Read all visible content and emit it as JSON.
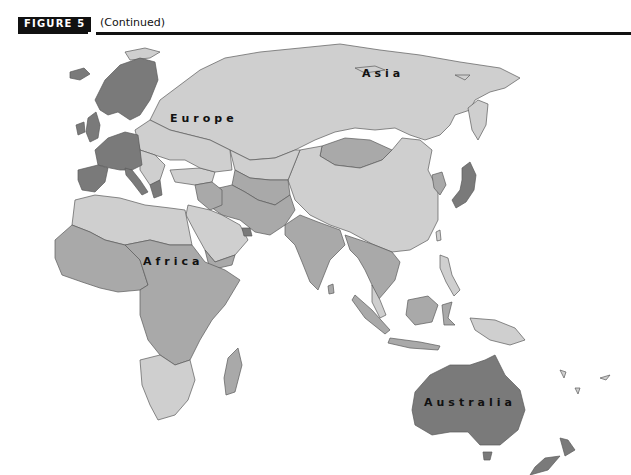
{
  "figure": {
    "label": "FIGURE 5",
    "caption": "(Continued)"
  },
  "map": {
    "type": "choropleth-world-map",
    "region_shown": "Eastern Hemisphere (Europe, Asia, Africa, Oceania)",
    "labels": {
      "europe": "Europe",
      "asia": "Asia",
      "africa": "Africa",
      "australia": "Australia"
    },
    "colors": {
      "ocean": "#ffffff",
      "dark_shade": "#7a7a7a",
      "medium_shade": "#a9a9a9",
      "light_shade": "#cfcfcf",
      "border": "#5a5a5a"
    },
    "shading": {
      "dark": [
        "Western Europe",
        "Scandinavia",
        "Japan",
        "Australia",
        "New Zealand",
        "United Arab Emirates"
      ],
      "medium": [
        "Central Asia",
        "Middle East",
        "South Asia",
        "Southeast Asia",
        "Sub-Saharan Africa",
        "Mongolia"
      ],
      "light": [
        "Russia",
        "Eastern Europe",
        "China",
        "North Africa",
        "Southern Africa",
        "Arabian Peninsula"
      ]
    }
  }
}
